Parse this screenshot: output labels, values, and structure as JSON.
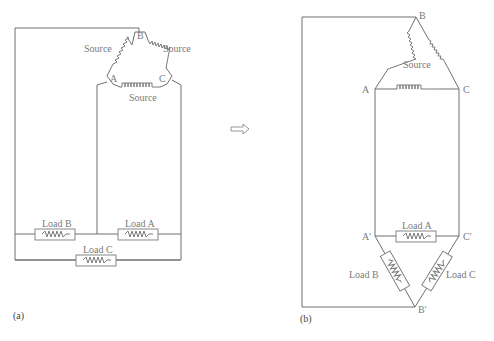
{
  "diagram": {
    "type": "circuit",
    "colors": {
      "line": "#6e6e6e",
      "text": "#7a7a7a",
      "background": "#ffffff"
    },
    "panel_a": {
      "caption": "(a)",
      "source_labels": {
        "ab": "Source",
        "bc": "Source",
        "ac": "Source"
      },
      "nodes": {
        "a": "A",
        "b": "B",
        "c": "C"
      },
      "loads": {
        "a": "Load A",
        "b": "Load B",
        "c": "Load C"
      }
    },
    "arrow": {
      "symbol": "⟹",
      "meaning": "is equivalent to"
    },
    "panel_b": {
      "caption": "(b)",
      "source_label": "Source",
      "nodes": {
        "a": "A",
        "b": "B",
        "c": "C",
        "a_prime": "A'",
        "b_prime": "B'",
        "c_prime": "C'"
      },
      "loads": {
        "a": "Load A",
        "b": "Load B",
        "c": "Load C"
      }
    }
  }
}
